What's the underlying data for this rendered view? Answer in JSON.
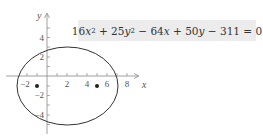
{
  "equation": {
    "text": "16x^2 + 25y^2 - 64x + 50y - 311 = 0",
    "parts": {
      "c1": "16",
      "v1": "x",
      "e1": "2",
      "op1": " + ",
      "c2": "25",
      "v2": "y",
      "e2": "2",
      "op2": " − ",
      "c3": "64",
      "v3": "x",
      "op3": " + ",
      "c4": "50",
      "v4": "y",
      "op4": " − ",
      "c5": "311",
      "eq": " = 0"
    },
    "background": "#ececec"
  },
  "axes": {
    "x_label": "x",
    "y_label": "y",
    "x_ticks": [
      "−2",
      "2",
      "4",
      "6",
      "8"
    ],
    "y_ticks": [
      "4",
      "2",
      "−2",
      "−4"
    ]
  },
  "ellipse": {
    "center": [
      2,
      -1
    ],
    "semi_major_x": 5,
    "semi_minor_y": 4,
    "foci": [
      [
        -1,
        -1
      ],
      [
        5,
        -1
      ]
    ],
    "stroke": "#333333"
  }
}
